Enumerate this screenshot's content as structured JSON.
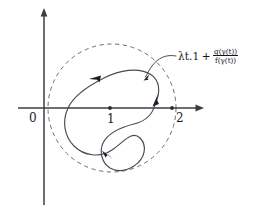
{
  "figure": {
    "background_color": "#ffffff",
    "axis_color": "#3c3c46",
    "curve_color": "#4a4a55",
    "dashed_circle_color": "#6b6b7a",
    "text_color": "#15151c"
  },
  "axes": {
    "x_axis_name": "horizontal-axis",
    "y_axis_name": "vertical-axis",
    "ticks": [
      {
        "label": "0",
        "value": 0,
        "px_x": 44
      },
      {
        "label": "1",
        "value": 1,
        "px_x": 110
      },
      {
        "label": "2",
        "value": 2,
        "px_x": 172
      }
    ],
    "origin_px": {
      "x": 44,
      "y": 108
    }
  },
  "dashed_circle": {
    "center_value": {
      "x": 1,
      "y": 0
    },
    "center_px": {
      "x": 112,
      "y": 108
    },
    "radius_px": 64,
    "style": "dashed"
  },
  "orbit": {
    "name": "closed-orbit-gamma",
    "direction": "clockwise",
    "arrow_count": 3
  },
  "annotation": {
    "lambda_term": "λt.1",
    "plus": "+",
    "numerator": "g(γ(t))",
    "denominator": "f(γ(t))",
    "full_text": "λt.1 + g(γ(t))/f(γ(t))"
  }
}
